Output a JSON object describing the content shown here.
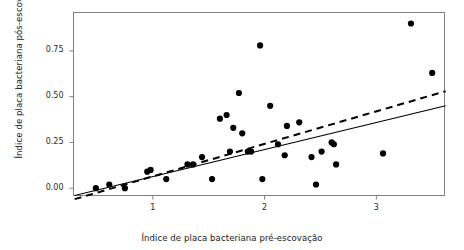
{
  "chart_data": {
    "type": "scatter",
    "title": "",
    "xlabel": "Índice de placa bacteriana pré-escovação",
    "ylabel": "Índice de placa bacteriana pós-escovação",
    "xlim": [
      0.29,
      3.61
    ],
    "ylim": [
      -0.04,
      0.96
    ],
    "grid": false,
    "legend": "none",
    "xticks": [
      1,
      2,
      3
    ],
    "xtick_labels": [
      "1",
      "2",
      "3"
    ],
    "yticks": [
      0.0,
      0.25,
      0.5,
      0.75
    ],
    "ytick_labels": [
      "0.00",
      "0.25",
      "0.50",
      "0.75"
    ],
    "point_color": "#000000",
    "points": [
      {
        "x": 0.49,
        "y": 0.0
      },
      {
        "x": 0.61,
        "y": 0.02
      },
      {
        "x": 0.75,
        "y": 0.0
      },
      {
        "x": 0.95,
        "y": 0.09
      },
      {
        "x": 0.98,
        "y": 0.1
      },
      {
        "x": 1.12,
        "y": 0.05
      },
      {
        "x": 1.31,
        "y": 0.13
      },
      {
        "x": 1.36,
        "y": 0.13
      },
      {
        "x": 1.44,
        "y": 0.17
      },
      {
        "x": 1.53,
        "y": 0.05
      },
      {
        "x": 1.6,
        "y": 0.38
      },
      {
        "x": 1.66,
        "y": 0.4
      },
      {
        "x": 1.69,
        "y": 0.2
      },
      {
        "x": 1.72,
        "y": 0.33
      },
      {
        "x": 1.77,
        "y": 0.52
      },
      {
        "x": 1.8,
        "y": 0.3
      },
      {
        "x": 1.85,
        "y": 0.2
      },
      {
        "x": 1.88,
        "y": 0.2
      },
      {
        "x": 1.96,
        "y": 0.78
      },
      {
        "x": 1.98,
        "y": 0.05
      },
      {
        "x": 2.05,
        "y": 0.45
      },
      {
        "x": 2.12,
        "y": 0.24
      },
      {
        "x": 2.18,
        "y": 0.18
      },
      {
        "x": 2.2,
        "y": 0.34
      },
      {
        "x": 2.31,
        "y": 0.36
      },
      {
        "x": 2.42,
        "y": 0.17
      },
      {
        "x": 2.46,
        "y": 0.02
      },
      {
        "x": 2.51,
        "y": 0.2
      },
      {
        "x": 2.6,
        "y": 0.25
      },
      {
        "x": 2.62,
        "y": 0.24
      },
      {
        "x": 2.64,
        "y": 0.13
      },
      {
        "x": 3.06,
        "y": 0.19
      },
      {
        "x": 3.31,
        "y": 0.9
      },
      {
        "x": 3.5,
        "y": 0.63
      }
    ],
    "lines": [
      {
        "name": "solid-regression-line",
        "style": "solid",
        "color": "#000000",
        "x0": 0.3,
        "y0": -0.04,
        "x1": 3.62,
        "y1": 0.45
      },
      {
        "name": "dashed-regression-line",
        "style": "dashed",
        "color": "#000000",
        "x0": 0.3,
        "y0": -0.06,
        "x1": 3.62,
        "y1": 0.53
      }
    ]
  }
}
